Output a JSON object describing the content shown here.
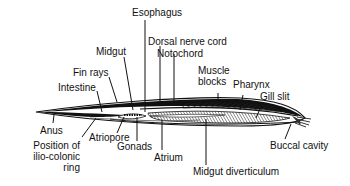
{
  "diagram": {
    "labels": {
      "esophagus": "Esophagus",
      "dorsal_nerve_cord": "Dorsal nerve cord",
      "notochord": "Notochord",
      "midgut": "Midgut",
      "fin_rays": "Fin rays",
      "intestine": "Intestine",
      "muscle_blocks_1": "Muscle",
      "muscle_blocks_2": "blocks",
      "pharynx": "Pharynx",
      "gill_slit": "Gill slit",
      "anus": "Anus",
      "ilio_1": "Position of",
      "ilio_2": "ilio-colonic",
      "ilio_3": "ring",
      "atriopore": "Atriopore",
      "gonads": "Gonads",
      "atrium": "Atrium",
      "midgut_diverticulum": "Midgut diverticulum",
      "buccal_cavity": "Buccal cavity"
    }
  }
}
